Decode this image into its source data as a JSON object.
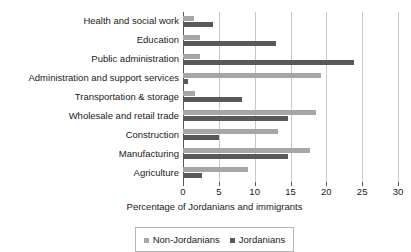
{
  "chart_data": {
    "type": "bar",
    "orientation": "horizontal",
    "title": "",
    "xlabel": "Percentage of Jordanians and immigrants",
    "ylabel": "",
    "xlim": [
      0,
      30
    ],
    "xticks": [
      0,
      5,
      10,
      15,
      20,
      25,
      30
    ],
    "xtick_labels": [
      "0",
      "5",
      "10",
      "15",
      "20",
      "25",
      "30"
    ],
    "grid": "vertical",
    "legend_position": "bottom",
    "categories": [
      "Health and social work",
      "Education",
      "Public administration",
      "Administration and support services",
      "Transportation & storage",
      "Wholesale and retail trade",
      "Construction",
      "Manufacturing",
      "Agriculture"
    ],
    "series": [
      {
        "name": "Non-Jordanians",
        "color": "#a6a6a6",
        "values": [
          1.5,
          2.4,
          2.4,
          19.3,
          1.7,
          18.6,
          13.3,
          17.7,
          9.0
        ]
      },
      {
        "name": "Jordanians",
        "color": "#595959",
        "values": [
          4.2,
          13.0,
          23.8,
          0.7,
          8.2,
          14.7,
          5.0,
          14.6,
          2.7
        ]
      }
    ]
  },
  "legend": {
    "items": [
      {
        "label": "Non-Jordanians",
        "swatch": "non-jordanians"
      },
      {
        "label": "Jordanians",
        "swatch": "jordanians"
      }
    ]
  },
  "colors": {
    "non_jordanians": "#a6a6a6",
    "jordanians": "#595959",
    "gridline": "#c9c9c9",
    "axis": "#595959",
    "background": "#ffffff"
  }
}
